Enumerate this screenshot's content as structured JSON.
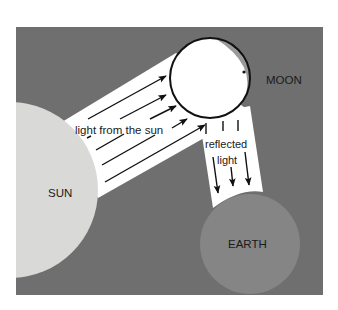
{
  "diagram": {
    "labels": {
      "sun": "SUN",
      "moon": "MOON",
      "earth": "EARTH",
      "incoming": "light from the sun",
      "reflected_1": "reflected",
      "reflected_2": "light"
    },
    "colors": {
      "background": "#6f6f6f",
      "sun": "#d9d9d7",
      "moon": "#ffffff",
      "moon_shadow": "#9a9a9a",
      "earth": "#858585",
      "beam": "#ffffff",
      "ink": "#111111"
    },
    "bodies": {
      "sun": {
        "cx": 10,
        "cy": 190,
        "r": 88
      },
      "moon": {
        "cx": 210,
        "cy": 78,
        "r": 40
      },
      "earth": {
        "cx": 250,
        "cy": 244,
        "r": 50
      }
    }
  }
}
